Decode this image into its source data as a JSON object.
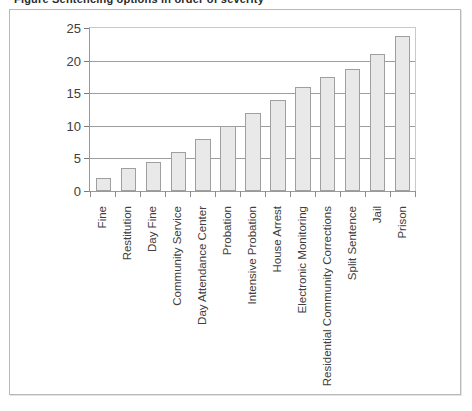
{
  "caption": {
    "text": "Figure  Sentencing options in order of severity"
  },
  "chart_data": {
    "type": "bar",
    "title": "",
    "xlabel": "",
    "ylabel": "",
    "ylim": [
      0,
      25
    ],
    "yticks": [
      0,
      5,
      10,
      15,
      20,
      25
    ],
    "ytick_labels": [
      "0",
      "5",
      "10",
      "15",
      "20",
      "25"
    ],
    "grid": true,
    "legend": null,
    "categories": [
      "Fine",
      "Restitution",
      "Day Fine",
      "Community Service",
      "Day Attendance Center",
      "Probation",
      "Intensive Probation",
      "House Arrest",
      "Electronic Monitoring",
      "Residential Community Corrections",
      "Split Sentence",
      "Jail",
      "Prison"
    ],
    "values": [
      2,
      3.5,
      4.5,
      6,
      8,
      10,
      12,
      14,
      16,
      17.5,
      18.7,
      21,
      23.7
    ],
    "bar_fill": "#e9e9e9",
    "bar_border": "#9f9f9f",
    "gridline_color": "#9e9e9e",
    "axis_color": "#9a9a9a",
    "text_color": "#404040"
  }
}
